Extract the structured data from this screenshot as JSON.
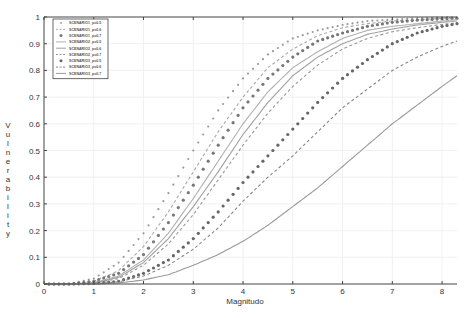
{
  "chart_data": {
    "type": "line",
    "title": "",
    "xlabel": "Magnitudo",
    "ylabel": "Vulnerability",
    "xlim": [
      0,
      8.3
    ],
    "ylim": [
      0,
      1
    ],
    "x_ticks": [
      "0",
      "1",
      "2",
      "3",
      "4",
      "5",
      "6",
      "7",
      "8"
    ],
    "y_ticks": [
      "0",
      "0.1",
      "0.2",
      "0.3",
      "0.4",
      "0.5",
      "0.6",
      "0.7",
      "0.8",
      "0.9",
      "1"
    ],
    "grid": true,
    "legend_position": "top-left",
    "series": [
      {
        "name": "SCENARIO1_p=0.5",
        "style": "dotted-small",
        "color": "#9a9a9a",
        "x": [
          0.5,
          1,
          1.5,
          2,
          2.5,
          3,
          3.5,
          4,
          4.5,
          5,
          5.5,
          6,
          6.5,
          7,
          7.5,
          8,
          8.3
        ],
        "y": [
          0.0,
          0.02,
          0.08,
          0.19,
          0.34,
          0.5,
          0.65,
          0.77,
          0.86,
          0.92,
          0.95,
          0.97,
          0.985,
          0.99,
          0.995,
          0.998,
          0.999
        ]
      },
      {
        "name": "SCENARIO1_p=0.6",
        "style": "dashed",
        "color": "#a8a8a8",
        "x": [
          0.5,
          1,
          1.5,
          2,
          2.5,
          3,
          3.5,
          4,
          4.5,
          5,
          5.5,
          6,
          6.5,
          7,
          7.5,
          8,
          8.3
        ],
        "y": [
          0.0,
          0.01,
          0.05,
          0.14,
          0.27,
          0.42,
          0.57,
          0.7,
          0.81,
          0.88,
          0.93,
          0.96,
          0.975,
          0.985,
          0.99,
          0.995,
          0.997
        ]
      },
      {
        "name": "SCENARIO1_p=0.7",
        "style": "dotted-large",
        "color": "#777777",
        "x": [
          0.5,
          1,
          1.5,
          2,
          2.5,
          3,
          3.5,
          4,
          4.5,
          5,
          5.5,
          6,
          6.5,
          7,
          7.5,
          8,
          8.3
        ],
        "y": [
          0.0,
          0.01,
          0.04,
          0.11,
          0.23,
          0.37,
          0.52,
          0.66,
          0.77,
          0.85,
          0.91,
          0.94,
          0.965,
          0.98,
          0.988,
          0.993,
          0.995
        ]
      },
      {
        "name": "SCENARIO2_p=0.5",
        "style": "solid",
        "color": "#b0b0b0",
        "x": [
          0.5,
          1,
          1.5,
          2,
          2.5,
          3,
          3.5,
          4,
          4.5,
          5,
          5.5,
          6,
          6.5,
          7,
          7.5,
          8,
          8.3
        ],
        "y": [
          0.0,
          0.005,
          0.03,
          0.09,
          0.19,
          0.32,
          0.46,
          0.6,
          0.72,
          0.81,
          0.87,
          0.92,
          0.95,
          0.965,
          0.975,
          0.985,
          0.99
        ]
      },
      {
        "name": "SCENARIO2_p=0.6",
        "style": "solid",
        "color": "#a0a0a0",
        "x": [
          0.5,
          1,
          1.5,
          2,
          2.5,
          3,
          3.5,
          4,
          4.5,
          5,
          5.5,
          6,
          6.5,
          7,
          7.5,
          8,
          8.3
        ],
        "y": [
          0.0,
          0.004,
          0.025,
          0.08,
          0.17,
          0.29,
          0.42,
          0.56,
          0.68,
          0.78,
          0.85,
          0.9,
          0.935,
          0.955,
          0.97,
          0.98,
          0.985
        ]
      },
      {
        "name": "SCENARIO2_p=0.7",
        "style": "dashed",
        "color": "#999999",
        "x": [
          0.5,
          1,
          1.5,
          2,
          2.5,
          3,
          3.5,
          4,
          4.5,
          5,
          5.5,
          6,
          6.5,
          7,
          7.5,
          8,
          8.3
        ],
        "y": [
          0.0,
          0.003,
          0.02,
          0.07,
          0.15,
          0.26,
          0.39,
          0.52,
          0.64,
          0.74,
          0.82,
          0.88,
          0.92,
          0.945,
          0.96,
          0.972,
          0.978
        ]
      },
      {
        "name": "SCENARIO3_p=0.5",
        "style": "dotted-large",
        "color": "#666666",
        "x": [
          0.5,
          1,
          1.5,
          2,
          2.5,
          3,
          3.5,
          4,
          4.5,
          5,
          5.5,
          6,
          6.5,
          7,
          7.5,
          8,
          8.3
        ],
        "y": [
          0.0,
          0.002,
          0.01,
          0.04,
          0.09,
          0.17,
          0.27,
          0.38,
          0.48,
          0.58,
          0.68,
          0.77,
          0.84,
          0.9,
          0.94,
          0.965,
          0.975
        ]
      },
      {
        "name": "SCENARIO3_p=0.6",
        "style": "dashed",
        "color": "#888888",
        "x": [
          0.5,
          1,
          1.5,
          2,
          2.5,
          3,
          3.5,
          4,
          4.5,
          5,
          5.5,
          6,
          6.5,
          7,
          7.5,
          8,
          8.3
        ],
        "y": [
          0.0,
          0.001,
          0.008,
          0.03,
          0.07,
          0.13,
          0.21,
          0.31,
          0.4,
          0.48,
          0.57,
          0.66,
          0.73,
          0.8,
          0.85,
          0.89,
          0.91
        ]
      },
      {
        "name": "SCENARIO3_p=0.7",
        "style": "solid",
        "color": "#999999",
        "x": [
          0.5,
          1,
          1.5,
          2,
          2.5,
          3,
          3.5,
          4,
          4.5,
          5,
          5.5,
          6,
          6.5,
          7,
          7.5,
          8,
          8.3
        ],
        "y": [
          0.0,
          0.0,
          0.004,
          0.015,
          0.035,
          0.07,
          0.11,
          0.16,
          0.22,
          0.29,
          0.36,
          0.44,
          0.52,
          0.6,
          0.67,
          0.74,
          0.78
        ]
      }
    ]
  }
}
